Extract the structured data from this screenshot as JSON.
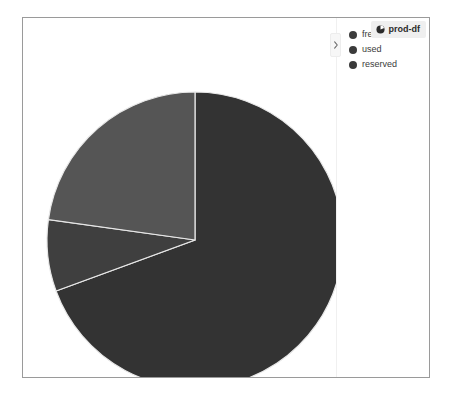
{
  "badge": {
    "label": "prod-df",
    "icon": "pie-chart-icon",
    "background_color": "#efefef",
    "text_color": "#2b2b2b"
  },
  "legend": {
    "toggle_icon": "chevron-right-icon",
    "items": [
      {
        "label": "free",
        "color": "#3c3c3c"
      },
      {
        "label": "used",
        "color": "#3a3a3a"
      },
      {
        "label": "reserved",
        "color": "#3a3a3a"
      }
    ]
  },
  "chart_data": {
    "type": "pie",
    "title": "",
    "labels": [
      "free",
      "used",
      "reserved"
    ],
    "values": [
      69.4,
      7.8,
      22.8
    ],
    "colors": [
      "#333333",
      "#3f3f3f",
      "#555555"
    ],
    "slice_border_color": "#e8e8e8",
    "start_angle_deg": 0,
    "direction": "clockwise",
    "center": {
      "x": 172,
      "y": 222
    },
    "radius": 148,
    "legend_position": "right",
    "grid": false
  }
}
